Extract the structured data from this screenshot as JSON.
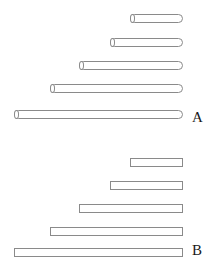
{
  "figure": {
    "title": "",
    "background_color": "#ffffff",
    "stroke_color": "#8a8a8a",
    "fill_color": "#ffffff",
    "label_color": "#1a1a1a",
    "width": 218,
    "height": 272
  },
  "panels": [
    {
      "id": "A",
      "label": "A",
      "style": "cylinder",
      "label_x": 192,
      "label_y": 110,
      "bars": [
        {
          "name": "bar-a-1",
          "left": 130,
          "right": 183,
          "top": 14,
          "length": 53
        },
        {
          "name": "bar-a-2",
          "left": 110,
          "right": 183,
          "top": 38,
          "length": 73
        },
        {
          "name": "bar-a-3",
          "left": 79,
          "right": 183,
          "top": 61,
          "length": 104
        },
        {
          "name": "bar-a-4",
          "left": 50,
          "right": 183,
          "top": 84,
          "length": 133
        },
        {
          "name": "bar-a-5",
          "left": 14,
          "right": 183,
          "top": 110,
          "length": 169
        }
      ]
    },
    {
      "id": "B",
      "label": "B",
      "style": "rectangle",
      "label_x": 192,
      "label_y": 243,
      "bars": [
        {
          "name": "bar-b-1",
          "left": 130,
          "right": 183,
          "top": 158,
          "length": 53
        },
        {
          "name": "bar-b-2",
          "left": 110,
          "right": 183,
          "top": 181,
          "length": 73
        },
        {
          "name": "bar-b-3",
          "left": 79,
          "right": 183,
          "top": 204,
          "length": 104
        },
        {
          "name": "bar-b-4",
          "left": 50,
          "right": 183,
          "top": 227,
          "length": 133
        },
        {
          "name": "bar-b-5",
          "left": 14,
          "right": 183,
          "top": 248,
          "length": 169
        }
      ]
    }
  ],
  "chart_data": {
    "type": "bar",
    "title": "",
    "xlabel": "",
    "ylabel": "",
    "orientation": "horizontal",
    "grid": false,
    "legend": null,
    "panels": [
      {
        "name": "A",
        "render_style": "cylinder",
        "categories": [
          "1",
          "2",
          "3",
          "4",
          "5"
        ],
        "values": [
          53,
          73,
          104,
          133,
          169
        ],
        "note": "horizontal cylinders, common right edge, increasing length downward"
      },
      {
        "name": "B",
        "render_style": "rectangle",
        "categories": [
          "1",
          "2",
          "3",
          "4",
          "5"
        ],
        "values": [
          53,
          73,
          104,
          133,
          169
        ],
        "note": "horizontal rectangles, common right edge, increasing length downward"
      }
    ],
    "xlim": [
      0,
      169
    ],
    "tick_labels": []
  }
}
